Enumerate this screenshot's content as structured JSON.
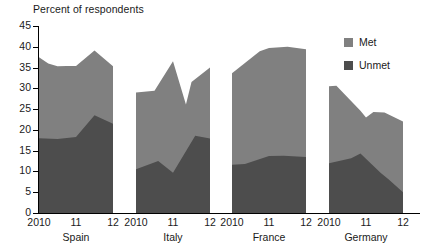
{
  "chart_data": {
    "type": "area",
    "title": "Percent of respondents",
    "subtitle": "",
    "xlabel": "",
    "ylabel": "Percent of respondents",
    "ylim": [
      0,
      45
    ],
    "ytick_step": 5,
    "yticks": [
      "45",
      "40",
      "35",
      "30",
      "25",
      "20",
      "15",
      "10",
      "5",
      "0"
    ],
    "grid": false,
    "stacked": true,
    "legend_position": "right",
    "panel_order": [
      "Spain",
      "Italy",
      "France",
      "Germany"
    ],
    "x_tick_labels": [
      "2010",
      "11",
      "12"
    ],
    "series": [
      {
        "name": "Met",
        "color": "#808080",
        "panels": {
          "Spain": [
            19.5,
            17.0,
            13.5
          ],
          "Italy": [
            18.5,
            16.5,
            17.0
          ],
          "France": [
            22.4,
            26.3,
            26.0
          ],
          "Germany": [
            18.5,
            10.0,
            17.0
          ]
        }
      },
      {
        "name": "Unmet",
        "color": "#4d4d4d",
        "panels": {
          "Spain": [
            18.0,
            18.3,
            21.5
          ],
          "Italy": [
            10.5,
            9.7,
            18.0
          ],
          "France": [
            11.6,
            13.7,
            13.5
          ],
          "Germany": [
            12.0,
            13.0,
            5.0
          ]
        }
      }
    ],
    "totals": {
      "Spain": [
        37.5,
        35.3,
        35.3
      ],
      "Italy": [
        29.0,
        26.2,
        35.0
      ],
      "France": [
        34.0,
        40.0,
        39.5
      ],
      "Germany": [
        30.5,
        23.0,
        22.0
      ]
    },
    "panel_shapes": {
      "Spain": {
        "total_points": [
          [
            0,
            37.5
          ],
          [
            0.25,
            36.0
          ],
          [
            0.5,
            35.3
          ],
          [
            0.75,
            35.4
          ],
          [
            1.0,
            35.4
          ],
          [
            1.5,
            39.1
          ],
          [
            2.0,
            35.3
          ]
        ],
        "unmet_points": [
          [
            0,
            18.0
          ],
          [
            0.5,
            17.8
          ],
          [
            1.0,
            18.3
          ],
          [
            1.5,
            23.5
          ],
          [
            2.0,
            21.5
          ]
        ]
      },
      "Italy": {
        "total_points": [
          [
            0,
            29.0
          ],
          [
            0.5,
            29.4
          ],
          [
            1.0,
            36.5
          ],
          [
            1.35,
            26.1
          ],
          [
            1.5,
            31.5
          ],
          [
            2.0,
            35.0
          ]
        ],
        "unmet_points": [
          [
            0,
            10.5
          ],
          [
            0.6,
            12.5
          ],
          [
            1.0,
            9.7
          ],
          [
            1.6,
            18.6
          ],
          [
            2.0,
            17.9
          ]
        ]
      },
      "France": {
        "total_points": [
          [
            0,
            33.6
          ],
          [
            0.75,
            38.9
          ],
          [
            1.0,
            39.7
          ],
          [
            1.5,
            40.0
          ],
          [
            2.0,
            39.4
          ]
        ],
        "unmet_points": [
          [
            0,
            11.6
          ],
          [
            0.35,
            11.8
          ],
          [
            1.0,
            13.7
          ],
          [
            1.4,
            13.8
          ],
          [
            2.0,
            13.5
          ]
        ]
      },
      "Germany": {
        "total_points": [
          [
            0,
            30.5
          ],
          [
            0.2,
            30.6
          ],
          [
            0.85,
            24.6
          ],
          [
            1.0,
            23.0
          ],
          [
            1.2,
            24.3
          ],
          [
            1.5,
            24.2
          ],
          [
            2.0,
            22.0
          ]
        ],
        "unmet_points": [
          [
            0,
            12.0
          ],
          [
            0.6,
            13.2
          ],
          [
            0.85,
            14.3
          ],
          [
            1.4,
            9.6
          ],
          [
            1.6,
            8.2
          ],
          [
            2.0,
            5.0
          ]
        ]
      }
    }
  },
  "axis": {
    "title": "Percent of respondents",
    "y_labels": [
      "45",
      "40",
      "35",
      "30",
      "25",
      "20",
      "15",
      "10",
      "5",
      "0"
    ]
  },
  "panels": [
    {
      "name": "Spain",
      "label": "Spain",
      "ticks": [
        "2010",
        "11",
        "12"
      ]
    },
    {
      "name": "Italy",
      "label": "Italy",
      "ticks": [
        "2010",
        "11",
        "12"
      ]
    },
    {
      "name": "France",
      "label": "France",
      "ticks": [
        "2010",
        "11",
        "12"
      ]
    },
    {
      "name": "Germany",
      "label": "Germany",
      "ticks": [
        "2010",
        "11",
        "12"
      ]
    }
  ],
  "legend": {
    "items": [
      {
        "label": "Met",
        "color": "#808080"
      },
      {
        "label": "Unmet",
        "color": "#4d4d4d"
      }
    ]
  },
  "colors": {
    "met": "#808080",
    "unmet": "#4d4d4d",
    "axis": "#000000",
    "text": "#1a1a1a",
    "background": "#ffffff"
  }
}
